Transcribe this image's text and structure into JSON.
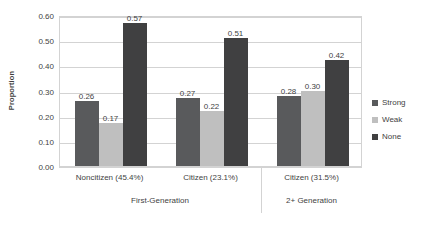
{
  "chart_data": {
    "type": "bar",
    "title": "",
    "subtitle": "",
    "xlabel": "",
    "ylabel": "Proportion",
    "ylim": [
      0.0,
      0.6
    ],
    "ytick_labels": [
      "0.00",
      "0.10",
      "0.20",
      "0.30",
      "0.40",
      "0.50",
      "0.60"
    ],
    "ytick_values": [
      0.0,
      0.1,
      0.2,
      0.3,
      0.4,
      0.5,
      0.6
    ],
    "grid": true,
    "legend_position": "right",
    "categories": [
      "Noncitizen (45.4%)",
      "Citizen (23.1%)",
      "Citizen (31.5%)"
    ],
    "group_labels": [
      "First-Generation",
      "2+ Generation"
    ],
    "group_spans": [
      2,
      1
    ],
    "series": [
      {
        "name": "Strong",
        "color": "#595a5c",
        "values": [
          0.26,
          0.27,
          0.28
        ],
        "labels": [
          "0.26",
          "0.27",
          "0.28"
        ]
      },
      {
        "name": "Weak",
        "color": "#bfbfbf",
        "values": [
          0.17,
          0.22,
          0.3
        ],
        "labels": [
          "0.17",
          "0.22",
          "0.30"
        ]
      },
      {
        "name": "None",
        "color": "#404041",
        "values": [
          0.57,
          0.51,
          0.42
        ],
        "labels": [
          "0.57",
          "0.51",
          "0.42"
        ]
      }
    ]
  },
  "legend": {
    "items": [
      {
        "label": "Strong",
        "color": "#595a5c"
      },
      {
        "label": "Weak",
        "color": "#bfbfbf"
      },
      {
        "label": "None",
        "color": "#404041"
      }
    ]
  },
  "colors": {
    "grid": "#d3d3d3",
    "text": "#3f3f3f",
    "background": "#ffffff"
  }
}
